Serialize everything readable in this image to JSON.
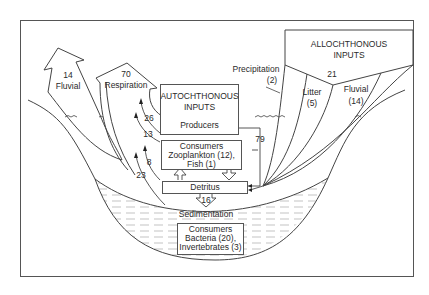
{
  "diagram": {
    "allochthonous": {
      "title_line1": "ALLOCHTHONOUS",
      "title_line2": "INPUTS",
      "total": "21",
      "precipitation_label": "Precipitation",
      "precipitation_value": "(2)",
      "litter_label": "Litter",
      "litter_value": "(5)",
      "fluvial_label": "Fluvial",
      "fluvial_value": "(14)"
    },
    "outputs": {
      "fluvial_value": "14",
      "fluvial_label": "Fluvial",
      "respiration_value": "70",
      "respiration_label": "Respiration"
    },
    "autochthonous": {
      "title_line1": "AUTOCHTHONOUS",
      "title_line2": "INPUTS",
      "producers": "Producers"
    },
    "consumers_pelagic": {
      "line1": "Consumers",
      "line2": "Zooplankton (12),",
      "line3": "Fish (1)"
    },
    "detritus": "Detritus",
    "sedimentation_value": "16",
    "sedimentation_label": "Sedimentation",
    "consumers_benthic": {
      "line1": "Consumers",
      "line2": "Bacteria (20),",
      "line3": "Invertebrates (3)"
    },
    "respiration_flows": [
      "26",
      "13",
      "8",
      "23"
    ],
    "to_detritus_flow": "79"
  }
}
